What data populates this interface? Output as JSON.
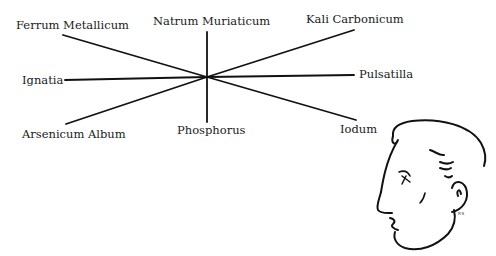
{
  "diagram": {
    "type": "radial-remedy-diagram",
    "center": {
      "x": 207,
      "y": 77
    },
    "remedies": [
      {
        "id": "ferrum-metallicum",
        "label": "Ferrum Metallicum",
        "position": "top-left"
      },
      {
        "id": "natrum-muriaticum",
        "label": "Natrum Muriaticum",
        "position": "top"
      },
      {
        "id": "kali-carbonicum",
        "label": "Kali Carbonicum",
        "position": "top-right"
      },
      {
        "id": "ignatia",
        "label": "Ignatia",
        "position": "left"
      },
      {
        "id": "pulsatilla",
        "label": "Pulsatilla",
        "position": "right"
      },
      {
        "id": "arsenicum-album",
        "label": "Arsenicum Album",
        "position": "bottom-left"
      },
      {
        "id": "phosphorus",
        "label": "Phosphorus",
        "position": "bottom"
      },
      {
        "id": "iodum",
        "label": "Iodum",
        "position": "bottom-right"
      }
    ],
    "illustration": {
      "subject": "male head in profile facing left",
      "signature": "RS"
    },
    "line_color": "#111111"
  }
}
